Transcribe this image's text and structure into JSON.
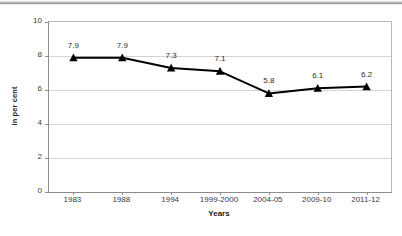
{
  "chart_data": {
    "type": "line",
    "title": "",
    "subtitle": "",
    "xlabel": "Years",
    "ylabel": "in per cent",
    "categories": [
      "1983",
      "1988",
      "1994",
      "1999-2000",
      "2004-05",
      "2009-10",
      "2011-12"
    ],
    "values": [
      7.9,
      7.9,
      7.3,
      7.1,
      5.8,
      6.1,
      6.2
    ],
    "point_labels": [
      "7.9",
      "7.9",
      "7.3",
      "7.1",
      "5.8",
      "6.1",
      "6.2"
    ],
    "ylim": [
      0,
      10
    ],
    "ytick_values": [
      0,
      2,
      4,
      6,
      8,
      10
    ],
    "ytick_labels": [
      "0",
      "2",
      "4",
      "6",
      "8",
      "10"
    ],
    "grid": true,
    "grid_axis": "y",
    "legend": false,
    "legend_position": "none",
    "marker": "triangle",
    "marker_color": "#000000",
    "line_color": "#000000",
    "gridline_color": "#d4d4d4",
    "axis_color": "#8c8c8c",
    "background_color": "#ffffff",
    "data_label_color": "#2b2b2b"
  }
}
